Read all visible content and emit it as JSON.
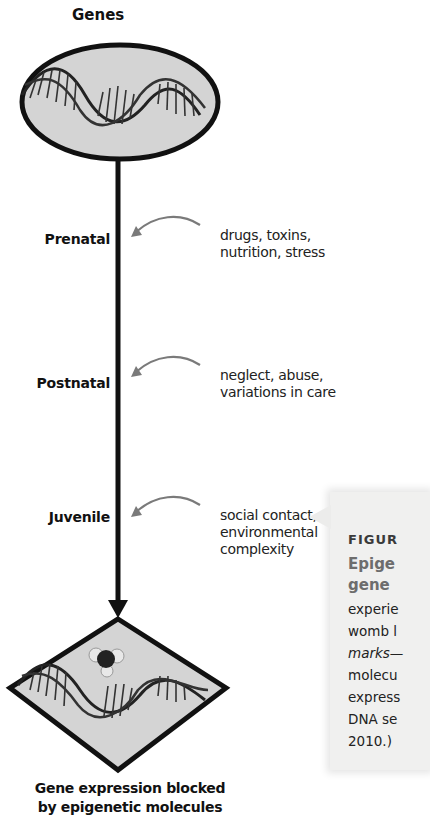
{
  "diagram": {
    "top_label": "Genes",
    "bottom_label_line1": "Gene expression blocked",
    "bottom_label_line2": "by epigenetic molecules",
    "stages": [
      {
        "label": "Prenatal",
        "cause_line1": "drugs, toxins,",
        "cause_line2": "nutrition, stress",
        "cause_line3": ""
      },
      {
        "label": "Postnatal",
        "cause_line1": "neglect, abuse,",
        "cause_line2": "variations in care",
        "cause_line3": ""
      },
      {
        "label": "Juvenile",
        "cause_line1": "social contact,",
        "cause_line2": "environmental",
        "cause_line3": "complexity"
      }
    ],
    "icons": {
      "top": "dna-helix-in-oval-icon",
      "bottom": "dna-helix-with-methyl-molecule-in-diamond-icon"
    },
    "colors": {
      "line": "#111111",
      "shape_fill": "#d4d4d4",
      "arrow_gray": "#7a7a7a",
      "caption_bg": "#f0f0ef",
      "caption_head": "#6d6d6d"
    }
  },
  "caption": {
    "figure_label": "FIGUR",
    "heading_line1": "Epige",
    "heading_line2": "gene",
    "body_lines": [
      "experie",
      "womb l",
      "marks—",
      "molecu",
      "express",
      "DNA se",
      "2010.)"
    ]
  }
}
